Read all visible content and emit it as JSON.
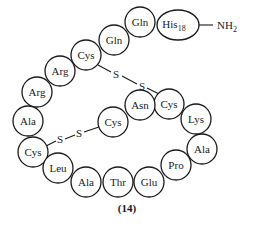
{
  "diagram": {
    "caption": "(14)",
    "terminus": {
      "label": "NH",
      "subscript": "2"
    },
    "residues": [
      {
        "name": "Cys",
        "index": 0
      },
      {
        "name": "Leu"
      },
      {
        "name": "Ala"
      },
      {
        "name": "Thr"
      },
      {
        "name": "Glu"
      },
      {
        "name": "Pro"
      },
      {
        "name": "Ala"
      },
      {
        "name": "Lys"
      },
      {
        "name": "Cys"
      },
      {
        "name": "Asn"
      },
      {
        "name": "Cys"
      },
      {
        "name": "Ala"
      },
      {
        "name": "Arg"
      },
      {
        "name": "Arg"
      },
      {
        "name": "Cys"
      },
      {
        "name": "Gln"
      },
      {
        "name": "Gln"
      },
      {
        "name": "His",
        "subscript": "18"
      }
    ],
    "disulfide_bonds": [
      {
        "from": "Cys (upper left)",
        "to": "Cys (right)",
        "atoms": [
          "S",
          "S"
        ]
      },
      {
        "from": "Cys (lower left)",
        "to": "Cys (inner)",
        "atoms": [
          "S",
          "S"
        ]
      }
    ],
    "labels": {
      "cys_left": "Cys",
      "leu": "Leu",
      "ala_bottom": "Ala",
      "thr": "Thr",
      "glu": "Glu",
      "pro": "Pro",
      "ala_right": "Ala",
      "lys": "Lys",
      "cys_right": "Cys",
      "asn": "Asn",
      "cys_inner": "Cys",
      "ala_left": "Ala",
      "arg_lower": "Arg",
      "arg_upper": "Arg",
      "cys_top": "Cys",
      "gln_lower": "Gln",
      "gln_upper": "Gln",
      "his": "His",
      "his_sub": "18",
      "s": "S"
    }
  }
}
